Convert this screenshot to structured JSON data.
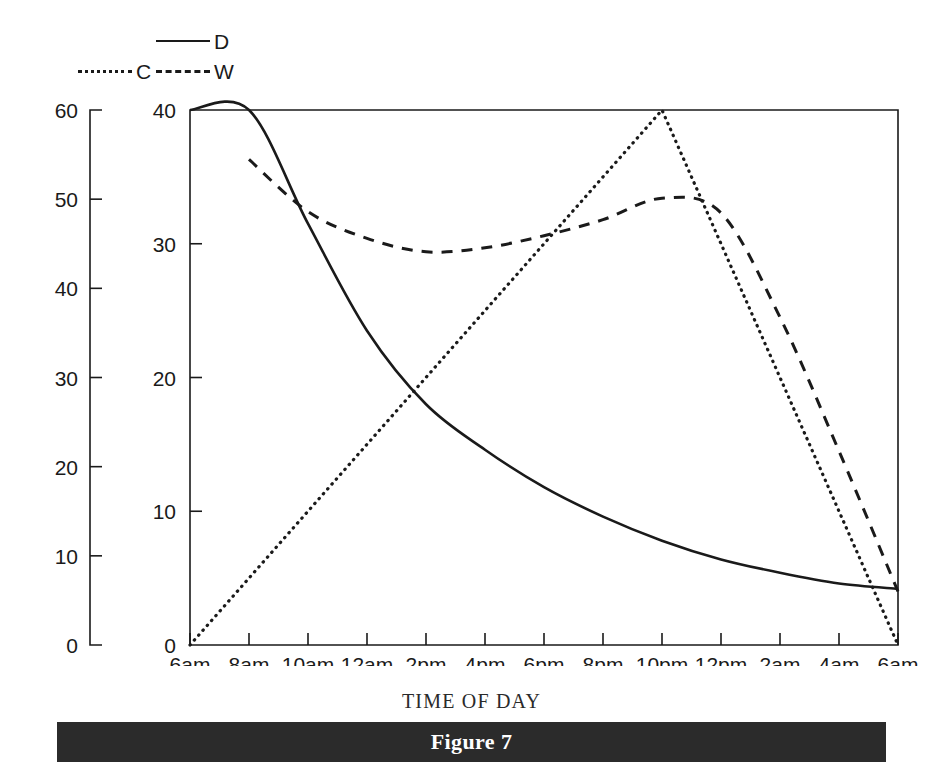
{
  "figure": {
    "caption": "Figure 7"
  },
  "legend": {
    "position": "above-plot",
    "entries": [
      {
        "key": "D",
        "label": "D",
        "style": "solid",
        "icon": "solid-line-icon"
      },
      {
        "key": "C",
        "label": "C",
        "style": "dotted",
        "icon": "dotted-line-icon"
      },
      {
        "key": "W",
        "label": "W",
        "style": "dashed",
        "icon": "dashed-line-icon"
      }
    ]
  },
  "axes": {
    "x_title": "TIME OF DAY",
    "left_outer_axis": {
      "ticks": [
        "0",
        "10",
        "20",
        "30",
        "40",
        "50",
        "60"
      ],
      "min": 0,
      "max": 60
    },
    "left_inner_axis": {
      "ticks": [
        "0",
        "10",
        "20",
        "30",
        "40"
      ],
      "min": 0,
      "max": 40
    },
    "x_ticks": [
      "6am",
      "8am",
      "10am",
      "12am",
      "2pm",
      "4pm",
      "6pm",
      "8pm",
      "10pm",
      "12pm",
      "2am",
      "4am",
      "6am"
    ]
  },
  "chart_data": {
    "type": "line",
    "title": "Figure 7",
    "xlabel": "TIME OF DAY",
    "ylabel": "",
    "grid": false,
    "legend_position": "top",
    "x": [
      "6am",
      "8am",
      "10am",
      "12am",
      "2pm",
      "4pm",
      "6pm",
      "8pm",
      "10pm",
      "12pm",
      "2am",
      "4am",
      "6am"
    ],
    "x_numeric": [
      0,
      2,
      4,
      6,
      8,
      10,
      12,
      14,
      16,
      18,
      20,
      22,
      24
    ],
    "xlim": [
      0,
      24
    ],
    "ylim_inner": [
      0,
      40
    ],
    "ylim_outer": [
      0,
      60
    ],
    "series": [
      {
        "name": "D",
        "label": "D",
        "style": "solid",
        "axis": "inner",
        "values": [
          40,
          40,
          31.5,
          23.5,
          18.0,
          14.6,
          11.8,
          9.6,
          7.8,
          6.4,
          5.4,
          4.6,
          4.2
        ]
      },
      {
        "name": "C",
        "label": "C",
        "style": "dotted",
        "axis": "inner",
        "values": [
          0,
          5.0,
          10.0,
          15.0,
          20.0,
          25.0,
          30.0,
          35.0,
          40.0,
          30.0,
          20.0,
          10.0,
          0
        ]
      },
      {
        "name": "W",
        "label": "W",
        "style": "dashed",
        "axis": "inner",
        "values": [
          null,
          36.3,
          32.4,
          30.4,
          29.4,
          29.7,
          30.6,
          31.8,
          33.4,
          32.3,
          24.5,
          14.5,
          4.0
        ]
      }
    ],
    "annotations": [
      {
        "text": "C peaks at 40 at 10pm"
      },
      {
        "text": "W minimum near 29.4 around 2pm"
      },
      {
        "text": "D decays monotonically from 40 to about 4"
      }
    ]
  }
}
